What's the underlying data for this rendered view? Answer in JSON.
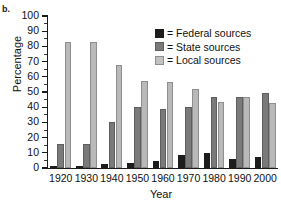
{
  "panel": {
    "label": "b."
  },
  "legend": {
    "position": "top-right",
    "equals_sign": "=",
    "entries": [
      {
        "label": "Federal sources",
        "color": "#1d1d1d",
        "swatch": "federal"
      },
      {
        "label": "State sources",
        "color": "#7a7a7a",
        "swatch": "state"
      },
      {
        "label": "Local sources",
        "color": "#c2c2c2",
        "swatch": "local"
      }
    ]
  },
  "axes": {
    "ylabel": "Percentage",
    "xlabel": "Year",
    "yticks": [
      0,
      10,
      20,
      30,
      40,
      50,
      60,
      70,
      80,
      90,
      100
    ]
  },
  "chart_data": {
    "type": "bar",
    "title": "",
    "xlabel": "Year",
    "ylabel": "Percentage",
    "ylim": [
      0,
      100
    ],
    "grid": false,
    "legend_position": "top-right",
    "categories": [
      "1920",
      "1930",
      "1940",
      "1950",
      "1960",
      "1970",
      "1980",
      "1990",
      "2000"
    ],
    "series": [
      {
        "name": "Federal sources",
        "color": "#1d1d1d",
        "values": [
          0.5,
          1,
          2.5,
          3,
          4.5,
          8.5,
          10,
          6,
          7.5
        ]
      },
      {
        "name": "State sources",
        "color": "#7a7a7a",
        "values": [
          16,
          16,
          30,
          40,
          39,
          40,
          47,
          47,
          49.5
        ]
      },
      {
        "name": "Local sources",
        "color": "#b9b9b9",
        "values": [
          83,
          83,
          68,
          57.5,
          56.5,
          52,
          43.5,
          46.5,
          43
        ]
      }
    ]
  }
}
